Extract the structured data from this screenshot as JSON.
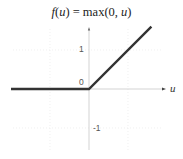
{
  "chart_data": {
    "type": "line",
    "title": "f(u) = max(0, u)",
    "title_parts": {
      "fn": "f",
      "arg": "u",
      "rest_a": "(",
      "rest_b": ") = max(0, ",
      "rest_c": ")"
    },
    "xlabel": "u",
    "ylabel": "",
    "yticks": [
      {
        "value": 1,
        "label": "1"
      },
      {
        "value": 0,
        "label": "0"
      },
      {
        "value": -1,
        "label": "-1"
      }
    ],
    "xlim": [
      -2.0,
      1.95
    ],
    "ylim": [
      -1.55,
      1.55
    ],
    "grid": true,
    "legend": null,
    "series": [
      {
        "name": "f(u) = max(0, u)",
        "color": "#333333",
        "x": [
          -2.0,
          0,
          1.6
        ],
        "y": [
          0,
          0,
          1.6
        ]
      }
    ]
  },
  "colors": {
    "line": "#333333",
    "axis": "#c8c8c8",
    "grid": "#e6e6e6",
    "text": "#555555"
  }
}
